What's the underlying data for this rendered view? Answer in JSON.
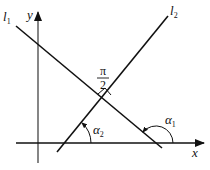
{
  "diagram": {
    "type": "geometry",
    "axes": {
      "x_label": "x",
      "y_label": "y"
    },
    "lines": [
      {
        "name": "l",
        "sub": "1",
        "direction": "descending"
      },
      {
        "name": "l",
        "sub": "2",
        "direction": "ascending"
      }
    ],
    "angles": [
      {
        "symbol": "α",
        "sub": "1",
        "description": "inclination angle of l1 with x-axis (obtuse)"
      },
      {
        "symbol": "α",
        "sub": "2",
        "description": "inclination angle of l2 with x-axis (acute)"
      }
    ],
    "right_angle": {
      "numerator": "π",
      "denominator": "2",
      "description": "l1 perpendicular to l2"
    },
    "colors": {
      "stroke": "#111111",
      "background": "#ffffff"
    }
  }
}
